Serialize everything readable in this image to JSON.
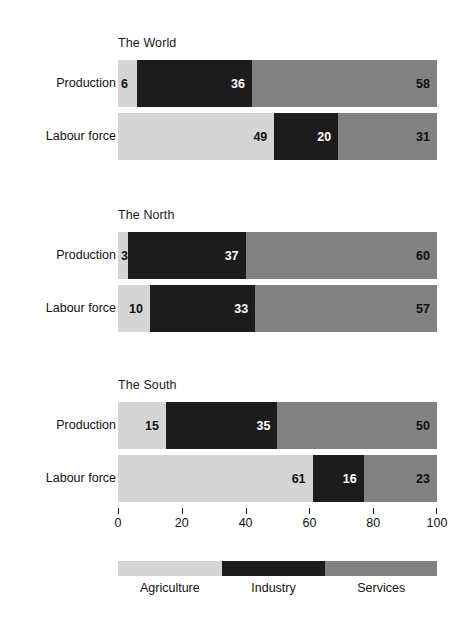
{
  "chart_data": {
    "type": "bar",
    "orientation": "horizontal",
    "stacked": true,
    "title": "",
    "xlabel": "",
    "ylabel": "",
    "xlim": [
      0,
      100
    ],
    "x_ticks": [
      0,
      20,
      40,
      60,
      80,
      100
    ],
    "x_tick_labels": [
      "0",
      "20",
      "40",
      "60",
      "80",
      "100"
    ],
    "grid": false,
    "legend_position": "bottom",
    "legend": [
      {
        "name": "Agriculture",
        "color": "#d5d5d5"
      },
      {
        "name": "Industry",
        "color": "#1c1c1c"
      },
      {
        "name": "Services",
        "color": "#828282"
      }
    ],
    "groups": [
      {
        "title": "The World",
        "rows": [
          {
            "label": "Production",
            "segments": [
              {
                "series": "Agriculture",
                "value": 6,
                "label": "6"
              },
              {
                "series": "Industry",
                "value": 36,
                "label": "36"
              },
              {
                "series": "Services",
                "value": 58,
                "label": "58"
              }
            ]
          },
          {
            "label": "Labour force",
            "segments": [
              {
                "series": "Agriculture",
                "value": 49,
                "label": "49"
              },
              {
                "series": "Industry",
                "value": 20,
                "label": "20"
              },
              {
                "series": "Services",
                "value": 31,
                "label": "31"
              }
            ]
          }
        ]
      },
      {
        "title": "The North",
        "rows": [
          {
            "label": "Production",
            "segments": [
              {
                "series": "Agriculture",
                "value": 3,
                "label": "3"
              },
              {
                "series": "Industry",
                "value": 37,
                "label": "37"
              },
              {
                "series": "Services",
                "value": 60,
                "label": "60"
              }
            ]
          },
          {
            "label": "Labour force",
            "segments": [
              {
                "series": "Agriculture",
                "value": 10,
                "label": "10"
              },
              {
                "series": "Industry",
                "value": 33,
                "label": "33"
              },
              {
                "series": "Services",
                "value": 57,
                "label": "57"
              }
            ]
          }
        ]
      },
      {
        "title": "The South",
        "rows": [
          {
            "label": "Production",
            "segments": [
              {
                "series": "Agriculture",
                "value": 15,
                "label": "15"
              },
              {
                "series": "Industry",
                "value": 35,
                "label": "35"
              },
              {
                "series": "Services",
                "value": 50,
                "label": "50"
              }
            ]
          },
          {
            "label": "Labour force",
            "segments": [
              {
                "series": "Agriculture",
                "value": 61,
                "label": "61"
              },
              {
                "series": "Industry",
                "value": 16,
                "label": "16"
              },
              {
                "series": "Services",
                "value": 23,
                "label": "23"
              }
            ]
          }
        ]
      }
    ]
  },
  "layout": {
    "group_tops": [
      36,
      208,
      378
    ],
    "title_offset": 0,
    "row_offsets": [
      24,
      77
    ],
    "plot_left": 118,
    "plot_width": 319,
    "bar_height": 47
  }
}
